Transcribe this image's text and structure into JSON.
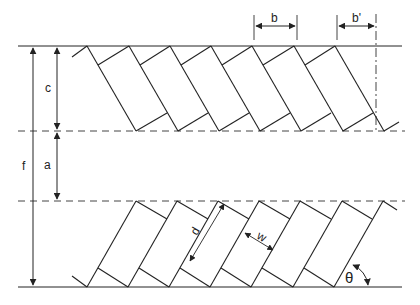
{
  "diagram": {
    "type": "staggered rectangular fin array geometry",
    "colors": {
      "line": "#222222",
      "dash": "#555555",
      "background": "#ffffff"
    },
    "labels": {
      "b": "b",
      "b_prime": "b'",
      "c": "c",
      "a": "a",
      "f": "f",
      "d": "d",
      "w": "w",
      "theta": "θ"
    },
    "dimensions": [
      {
        "label": "b",
        "meaning": "pitch between fins (horizontal)"
      },
      {
        "label": "b'",
        "meaning": "horizontal offset at edge"
      },
      {
        "label": "c",
        "meaning": "height of upper fin row"
      },
      {
        "label": "a",
        "meaning": "gap between rows"
      },
      {
        "label": "f",
        "meaning": "total height"
      },
      {
        "label": "d",
        "meaning": "fin length"
      },
      {
        "label": "w",
        "meaning": "fin width"
      },
      {
        "label": "θ",
        "meaning": "fin angle to base"
      }
    ]
  }
}
